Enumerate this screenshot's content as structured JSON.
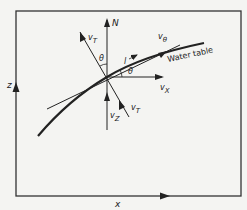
{
  "figure": {
    "type": "vector diagram",
    "curve_label": "Water table",
    "axes": {
      "x_label": "x",
      "z_label": "z"
    },
    "vectors": {
      "normal": "N",
      "v_theta": "v",
      "v_theta_sub": "θ",
      "v_x": "v",
      "v_x_sub": "X",
      "v_z": "v",
      "v_z_sub": "Z",
      "v_T_upper": "v",
      "v_T_upper_sub": "T",
      "v_T_lower": "v",
      "v_T_lower_sub": "T"
    },
    "angles": {
      "theta_upper": "θ",
      "theta_right": "θ"
    },
    "tangent_label": "l",
    "colors": {
      "line": "#222222",
      "background": "#f4f4f2"
    }
  }
}
